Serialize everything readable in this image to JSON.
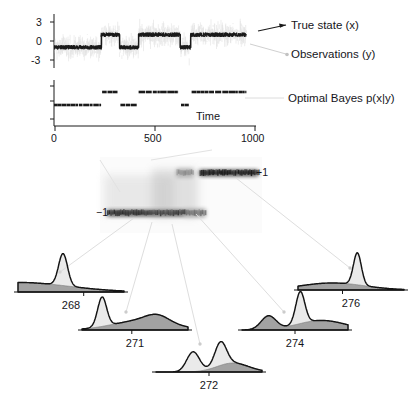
{
  "figure": {
    "type": "bayesian-filtering-figure",
    "background": "#ffffff",
    "ink_color": "#1a1a1a",
    "observation_color": "#c9c9c9",
    "prior_fill_color": "#8a8a8a",
    "posterior_fill_color": "#d8d8d8"
  },
  "top_panel": {
    "name": "state-trace",
    "y_ticks": [
      "3",
      "0",
      "-3"
    ],
    "y_tick_values": [
      3,
      0,
      -3
    ],
    "ylim": [
      -4.2,
      4.2
    ],
    "legend": [
      {
        "label": "True state  (x)",
        "color": "#1a1a1a",
        "arrow": "dark"
      },
      {
        "label": "Observations  (y)",
        "color": "#bdbdbd",
        "arrow": "light"
      }
    ]
  },
  "bayes_panel": {
    "name": "optimal-bayes-panel",
    "label": "Optimal Bayes  p(x|y)",
    "x_axis_label": "Time",
    "x_ticks": [
      "0",
      "500",
      "1000"
    ],
    "x_tick_values": [
      0,
      500,
      1000
    ]
  },
  "heatmap_panel": {
    "name": "posterior-density-heatmap",
    "label_high": "+1",
    "label_low": "−1",
    "colormap": "grayscale-inverted"
  },
  "snapshots": {
    "title": "posterior-snapshots",
    "panels": [
      {
        "id": "p268",
        "label": "268",
        "tick_at": 0.62
      },
      {
        "id": "p271",
        "label": "271",
        "tick_at": 0.47
      },
      {
        "id": "p272",
        "label": "272",
        "tick_at": 0.5
      },
      {
        "id": "p274",
        "label": "274",
        "tick_at": 0.5
      },
      {
        "id": "p276",
        "label": "276",
        "tick_at": 0.42
      }
    ]
  },
  "chart_data": {
    "type": "line",
    "title": "",
    "subtitle": "",
    "xlabel": "Time",
    "ylabel": "",
    "panels": [
      {
        "name": "true-state-and-observations",
        "type": "line",
        "ylim": [
          -4.2,
          4.2
        ],
        "yticks": [
          3,
          0,
          -3
        ],
        "xlim": [
          0,
          1050
        ],
        "grid": false,
        "series": [
          {
            "name": "Observations  (y)",
            "color": "#c9c9c9",
            "style": "noise-cloud",
            "noise_sigma": 1.35,
            "comment": "dense faint gaussian scatter around true state"
          },
          {
            "name": "True state  (x)",
            "color": "#1a1a1a",
            "style": "telegraph",
            "levels": [
              -1,
              1
            ],
            "segments": [
              {
                "t_start": 0,
                "t_end": 245,
                "state": -1
              },
              {
                "t_start": 245,
                "t_end": 340,
                "state": 1
              },
              {
                "t_start": 340,
                "t_end": 440,
                "state": -1
              },
              {
                "t_start": 440,
                "t_end": 655,
                "state": 1
              },
              {
                "t_start": 655,
                "t_end": 710,
                "state": -1
              },
              {
                "t_start": 710,
                "t_end": 1000,
                "state": 1
              }
            ]
          }
        ]
      },
      {
        "name": "optimal-bayes-posterior-mean",
        "type": "line",
        "xlim": [
          0,
          1050
        ],
        "xticks": [
          0,
          500,
          1000
        ],
        "grid": false,
        "series": [
          {
            "name": "Optimal Bayes  p(x|y)",
            "color": "#1a1a1a",
            "style": "telegraph",
            "levels": [
              -1,
              1
            ],
            "segments": [
              {
                "t_start": 0,
                "t_end": 245,
                "state": -1
              },
              {
                "t_start": 250,
                "t_end": 330,
                "state": 1
              },
              {
                "t_start": 345,
                "t_end": 430,
                "state": -1
              },
              {
                "t_start": 440,
                "t_end": 650,
                "state": 1
              },
              {
                "t_start": 660,
                "t_end": 705,
                "state": -1
              },
              {
                "t_start": 715,
                "t_end": 1000,
                "state": 1
              }
            ]
          }
        ]
      },
      {
        "name": "posterior-density-over-time",
        "type": "heatmap",
        "ylabels": [
          "+1",
          "−1"
        ],
        "colormap": "grayscale-inverted",
        "description": "posterior density p(x|y) as grayscale image; dark band at -1 for early times, transition zone in middle, dark band at +1 for late times",
        "bands": [
          {
            "level": "−1",
            "t_start": 0.02,
            "t_end": 0.52,
            "intensity": 0.95
          },
          {
            "level": "−1",
            "t_start": 0.52,
            "t_end": 0.66,
            "intensity": 0.45
          },
          {
            "level": "+1",
            "t_start": 0.47,
            "t_end": 0.58,
            "intensity": 0.35
          },
          {
            "level": "+1",
            "t_start": 0.62,
            "t_end": 1.0,
            "intensity": 0.97
          }
        ]
      },
      {
        "name": "posterior-snapshots",
        "type": "line",
        "description": "five posterior density snapshots at selected timepoints; black curve = optimal Bayes posterior, gray shaded = approximate/prior density",
        "distributions": [
          {
            "label": "268",
            "peaks": [
              {
                "center": -1.0,
                "height": 0.3,
                "width": 0.95,
                "series": "gray"
              },
              {
                "center": -0.15,
                "height": 1.0,
                "width": 0.085,
                "series": "black"
              }
            ]
          },
          {
            "label": "271",
            "peaks": [
              {
                "center": -0.62,
                "height": 0.92,
                "width": 0.085,
                "series": "black"
              },
              {
                "center": 0.15,
                "height": 0.3,
                "width": 0.55,
                "series": "gray"
              },
              {
                "center": 0.42,
                "height": 0.22,
                "width": 0.22,
                "series": "gray"
              }
            ]
          },
          {
            "label": "272",
            "peaks": [
              {
                "center": -0.3,
                "height": 0.62,
                "width": 0.12,
                "series": "black"
              },
              {
                "center": 0.22,
                "height": 0.74,
                "width": 0.11,
                "series": "black"
              },
              {
                "center": 0.45,
                "height": 0.28,
                "width": 0.3,
                "series": "gray"
              }
            ]
          },
          {
            "label": "274",
            "peaks": [
              {
                "center": -0.5,
                "height": 0.42,
                "width": 0.14,
                "series": "gray"
              },
              {
                "center": 0.1,
                "height": 1.0,
                "width": 0.085,
                "series": "black"
              },
              {
                "center": 0.5,
                "height": 0.3,
                "width": 0.45,
                "series": "gray"
              }
            ]
          },
          {
            "label": "276",
            "peaks": [
              {
                "center": -0.35,
                "height": 0.22,
                "width": 0.6,
                "series": "gray"
              },
              {
                "center": 0.12,
                "height": 1.0,
                "width": 0.075,
                "series": "black"
              }
            ]
          }
        ]
      }
    ]
  }
}
